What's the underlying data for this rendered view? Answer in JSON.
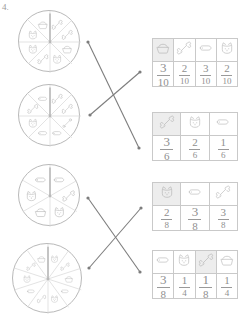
{
  "worksheet": {
    "question_number": "4.",
    "instruction_note": ""
  },
  "spinners": [
    {
      "id": "spinner-1",
      "sections": 8,
      "icons": [
        "bone",
        "bone",
        "dog-bowl",
        "cat-face",
        "bone",
        "cat-face",
        "cat-face",
        "dog-bowl"
      ],
      "pointer_angle_deg": 0
    },
    {
      "id": "spinner-2",
      "sections": 8,
      "icons": [
        "bone",
        "bone",
        "dog-bone",
        "dog-treat",
        "dog-treat",
        "cat-face",
        "bone",
        "dog-treat"
      ],
      "pointer_angle_deg": 0
    },
    {
      "id": "spinner-3",
      "sections": 6,
      "icons": [
        "dog-treat",
        "bone",
        "cat-face",
        "dog-bowl",
        "cat-face",
        "dog-treat"
      ],
      "pointer_angle_deg": 0
    },
    {
      "id": "spinner-4",
      "sections": 10,
      "icons": [
        "cat-face",
        "bone",
        "dog-bowl",
        "dog-treat",
        "cat-face",
        "bone",
        "dog-treat",
        "cat-face",
        "bone",
        "dog-bowl"
      ],
      "pointer_angle_deg": 0
    }
  ],
  "tables": [
    {
      "id": "table-1",
      "columns": 4,
      "icons": [
        "dog-bowl",
        "bone",
        "dog-treat",
        "cat-face"
      ],
      "shaded": [
        true,
        false,
        false,
        false
      ],
      "fractions": [
        {
          "numerator": "3",
          "denominator": "10",
          "emphasis": "big"
        },
        {
          "numerator": "2",
          "denominator": "10",
          "emphasis": "small"
        },
        {
          "numerator": "3",
          "denominator": "10",
          "emphasis": "small"
        },
        {
          "numerator": "2",
          "denominator": "10",
          "emphasis": "small"
        }
      ]
    },
    {
      "id": "table-2",
      "columns": 3,
      "icons": [
        "bone",
        "cat-face",
        "dog-treat"
      ],
      "shaded": [
        true,
        false,
        false
      ],
      "fractions": [
        {
          "numerator": "3",
          "denominator": "6",
          "emphasis": "big"
        },
        {
          "numerator": "2",
          "denominator": "6",
          "emphasis": "small"
        },
        {
          "numerator": "1",
          "denominator": "6",
          "emphasis": "small"
        }
      ]
    },
    {
      "id": "table-3",
      "columns": 3,
      "icons": [
        "cat-face",
        "dog-treat",
        "bone"
      ],
      "shaded": [
        true,
        false,
        false
      ],
      "fractions": [
        {
          "numerator": "2",
          "denominator": "8",
          "emphasis": "small"
        },
        {
          "numerator": "3",
          "denominator": "8",
          "emphasis": "big"
        },
        {
          "numerator": "3",
          "denominator": "8",
          "emphasis": "small"
        }
      ]
    },
    {
      "id": "table-4",
      "columns": 4,
      "icons": [
        "dog-treat",
        "cat-face",
        "bone",
        "dog-bowl"
      ],
      "shaded": [
        false,
        false,
        true,
        false
      ],
      "fractions": [
        {
          "numerator": "3",
          "denominator": "8",
          "emphasis": "big"
        },
        {
          "numerator": "1",
          "denominator": "4",
          "emphasis": "small"
        },
        {
          "numerator": "1",
          "denominator": "8",
          "emphasis": "big"
        },
        {
          "numerator": "1",
          "denominator": "4",
          "emphasis": "small"
        }
      ]
    }
  ],
  "connectors": [
    {
      "id": "line-1",
      "from_spinner": 1,
      "to_table": 2,
      "x1": 88,
      "y1": 42,
      "x2": 139,
      "y2": 148
    },
    {
      "id": "line-2",
      "from_spinner": 2,
      "to_table": 1,
      "x1": 90,
      "y1": 115,
      "x2": 140,
      "y2": 72
    },
    {
      "id": "line-3",
      "from_spinner": 3,
      "to_table": 4,
      "x1": 88,
      "y1": 198,
      "x2": 140,
      "y2": 272
    },
    {
      "id": "line-4",
      "from_spinner": 4,
      "to_table": 3,
      "x1": 89,
      "y1": 268,
      "x2": 141,
      "y2": 208
    }
  ],
  "colors": {
    "ink": "#9a9a9a",
    "rule": "#c9c9c9",
    "shade": "#ededed",
    "line": "#7d7d7d",
    "spinner_ring": "#b9b9b9"
  }
}
